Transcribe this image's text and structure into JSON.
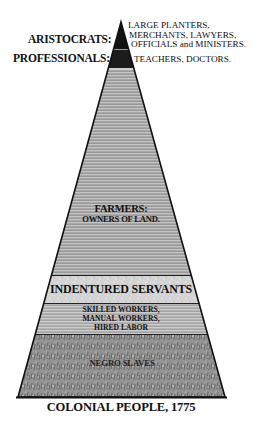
{
  "diagram": {
    "title": "COLONIAL PEOPLE, 1775",
    "type": "social-pyramid",
    "layers": [
      {
        "id": "aristocrats",
        "label": "ARISTOCRATS:",
        "members": [
          "LARGE PLANTERS,",
          "MERCHANTS, LAWYERS,",
          "OFFICIALS and MINISTERS."
        ],
        "fill": "#111111"
      },
      {
        "id": "professionals",
        "label": "PROFESSIONALS:",
        "members": [
          "TEACHERS, DOCTORS."
        ],
        "fill": "#1a1a1a"
      },
      {
        "id": "farmers",
        "label": "FARMERS:",
        "members": [
          "OWNERS OF LAND."
        ],
        "fill": "#a9a9a9"
      },
      {
        "id": "indentured",
        "label": "INDENTURED SERVANTS",
        "members": [],
        "fill": "#d2d2d2"
      },
      {
        "id": "workers",
        "label": "",
        "members": [
          "SKILLED WORKERS,",
          "MANUAL WORKERS,",
          "HIRED LABOR"
        ],
        "fill": "#b5b5b5"
      },
      {
        "id": "slaves",
        "label": "NEGRO SLAVES",
        "members": [],
        "fill": "#8e8e8e"
      }
    ]
  }
}
